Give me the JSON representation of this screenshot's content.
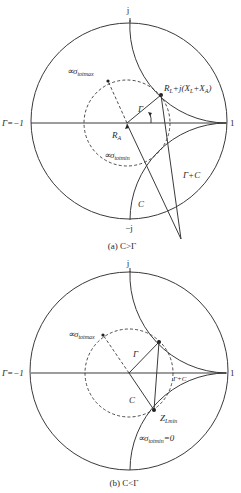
{
  "panels": [
    {
      "id": "a",
      "caption": "(a) C>Γ",
      "labels": {
        "top": "j",
        "bottom": "−j",
        "left": "Γ=−1",
        "right": "1",
        "center": "R",
        "center_sub": "A",
        "gamma": "Γ",
        "c": "C",
        "gamma_plus_c": "Γ+C",
        "sigma_max": "∝σ",
        "sigma_max_sub": "totmax",
        "sigma_min": "∝σ",
        "sigma_min_sub": "totmin",
        "load_point": "R",
        "load_point_sub": "L",
        "load_point_rest": "+j(X",
        "load_point_sub2": "L",
        "load_point_plus": "+X",
        "load_point_sub3": "A",
        "load_point_close": ")"
      }
    },
    {
      "id": "b",
      "caption": "(b) C<Γ",
      "labels": {
        "top": "j",
        "left": "Γ=−1",
        "right": "1",
        "gamma": "Γ",
        "c": "C",
        "gamma_plus_c": "Γ+C",
        "sigma_max": "∝σ",
        "sigma_max_sub": "totmax",
        "z_lmin": "Z",
        "z_lmin_sub": "Lmin",
        "sigma_min": "∝σ",
        "sigma_min_sub": "totmin",
        "sigma_min_eq": "=0"
      }
    }
  ]
}
